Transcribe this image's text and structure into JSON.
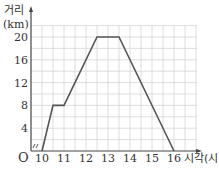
{
  "chart_data": {
    "type": "line",
    "title": "",
    "xlabel": "시각(시)",
    "ylabel_line1": "거리",
    "ylabel_line2": "(km)",
    "origin_label": "O",
    "xlim": [
      9.5,
      17
    ],
    "ylim": [
      0,
      22
    ],
    "x_ticks": [
      10,
      11,
      12,
      13,
      14,
      15,
      16
    ],
    "y_ticks": [
      4,
      8,
      12,
      16,
      20
    ],
    "grid": true,
    "axis_break": true,
    "x": [
      10,
      10.5,
      11,
      12.5,
      13.5,
      16
    ],
    "y": [
      0,
      8,
      8,
      20,
      20,
      0
    ],
    "line_color": "#555555",
    "grid_color": "#d6d6d6"
  }
}
